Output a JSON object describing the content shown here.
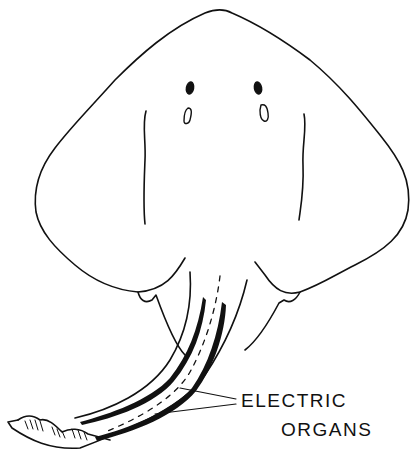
{
  "figure": {
    "label": {
      "line1": "ELECTRIC",
      "line2": "ORGANS"
    },
    "colors": {
      "background": "#ffffff",
      "ink": "#111111"
    }
  }
}
